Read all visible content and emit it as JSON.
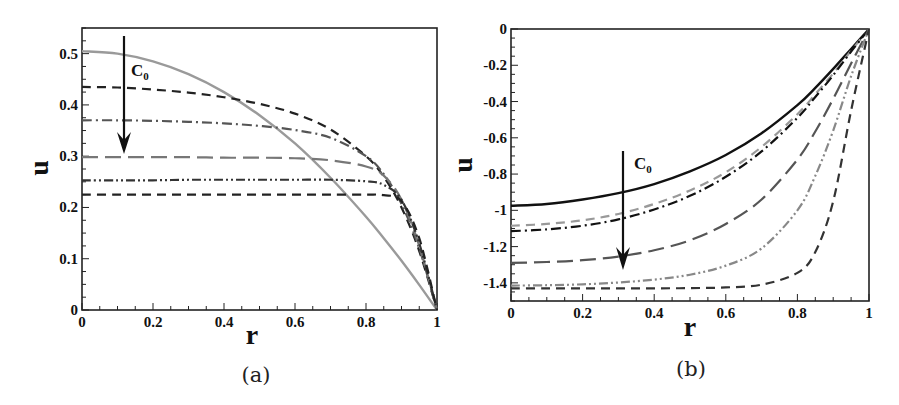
{
  "chart_data": [
    {
      "type": "line",
      "panel": "(a)",
      "xlabel": "r",
      "ylabel": "u",
      "xlim": [
        0,
        1
      ],
      "ylim": [
        0,
        0.55
      ],
      "xticks": [
        "0",
        "0.2",
        "0.4",
        "0.6",
        "0.8",
        "1"
      ],
      "yticks": [
        "0",
        "0.1",
        "0.2",
        "0.3",
        "0.4",
        "0.5"
      ],
      "grid": false,
      "annotation": {
        "text": "C",
        "subscript": "0",
        "arrow": "down",
        "meaning": "curves ordered with increasing C0"
      },
      "x": [
        0,
        0.1,
        0.2,
        0.3,
        0.4,
        0.5,
        0.6,
        0.7,
        0.8,
        0.85,
        0.9,
        0.95,
        1.0
      ],
      "series": [
        {
          "name": "curve-1",
          "style": "solid",
          "color": "#9a9a9a",
          "values": [
            0.505,
            0.5,
            0.485,
            0.46,
            0.425,
            0.38,
            0.325,
            0.258,
            0.182,
            0.14,
            0.096,
            0.049,
            0.0
          ]
        },
        {
          "name": "curve-2",
          "style": "dashed",
          "color": "#222222",
          "values": [
            0.435,
            0.434,
            0.43,
            0.424,
            0.415,
            0.402,
            0.383,
            0.352,
            0.3,
            0.26,
            0.2,
            0.115,
            0.0
          ]
        },
        {
          "name": "curve-3",
          "style": "dash-dot",
          "color": "#555555",
          "values": [
            0.37,
            0.37,
            0.369,
            0.367,
            0.364,
            0.359,
            0.351,
            0.336,
            0.3,
            0.265,
            0.207,
            0.12,
            0.0
          ]
        },
        {
          "name": "curve-4",
          "style": "long-dash",
          "color": "#777777",
          "values": [
            0.298,
            0.298,
            0.298,
            0.298,
            0.297,
            0.297,
            0.296,
            0.292,
            0.28,
            0.262,
            0.215,
            0.125,
            0.0
          ]
        },
        {
          "name": "curve-5",
          "style": "dash-dot-dot",
          "color": "#333333",
          "values": [
            0.253,
            0.253,
            0.253,
            0.254,
            0.254,
            0.254,
            0.254,
            0.254,
            0.251,
            0.244,
            0.215,
            0.13,
            0.0
          ]
        },
        {
          "name": "curve-6",
          "style": "dashed",
          "color": "#222222",
          "values": [
            0.225,
            0.225,
            0.225,
            0.225,
            0.225,
            0.225,
            0.225,
            0.225,
            0.225,
            0.224,
            0.212,
            0.14,
            0.0
          ]
        }
      ]
    },
    {
      "type": "line",
      "panel": "(b)",
      "xlabel": "r",
      "ylabel": "u",
      "xlim": [
        0,
        1
      ],
      "ylim": [
        -1.5,
        0
      ],
      "xticks": [
        "0",
        "0.2",
        "0.4",
        "0.6",
        "0.8",
        "1"
      ],
      "yticks": [
        "0",
        "-0.2",
        "-0.4",
        "-0.6",
        "-0.8",
        "-1",
        "-1.2",
        "-1.4"
      ],
      "grid": false,
      "annotation": {
        "text": "C",
        "subscript": "0",
        "arrow": "down",
        "meaning": "curves ordered with increasing C0"
      },
      "x": [
        0,
        0.1,
        0.2,
        0.3,
        0.4,
        0.5,
        0.6,
        0.7,
        0.8,
        0.85,
        0.9,
        0.95,
        1.0
      ],
      "series": [
        {
          "name": "curve-1",
          "style": "solid",
          "color": "#111111",
          "values": [
            -0.975,
            -0.965,
            -0.94,
            -0.905,
            -0.855,
            -0.785,
            -0.695,
            -0.575,
            -0.42,
            -0.325,
            -0.22,
            -0.11,
            0.0
          ]
        },
        {
          "name": "curve-2",
          "style": "dashed",
          "color": "#999999",
          "values": [
            -1.085,
            -1.075,
            -1.055,
            -1.02,
            -0.965,
            -0.89,
            -0.79,
            -0.65,
            -0.47,
            -0.36,
            -0.245,
            -0.12,
            0.0
          ]
        },
        {
          "name": "curve-3",
          "style": "dash-dot",
          "color": "#111111",
          "values": [
            -1.115,
            -1.105,
            -1.085,
            -1.05,
            -0.995,
            -0.92,
            -0.815,
            -0.675,
            -0.49,
            -0.375,
            -0.255,
            -0.125,
            0.0
          ]
        },
        {
          "name": "curve-4",
          "style": "long-dash",
          "color": "#555555",
          "values": [
            -1.29,
            -1.285,
            -1.275,
            -1.255,
            -1.22,
            -1.165,
            -1.075,
            -0.94,
            -0.72,
            -0.565,
            -0.385,
            -0.19,
            0.0
          ]
        },
        {
          "name": "curve-5",
          "style": "dash-dot-dot",
          "color": "#888888",
          "values": [
            -1.415,
            -1.413,
            -1.408,
            -1.398,
            -1.382,
            -1.355,
            -1.305,
            -1.21,
            -1.0,
            -0.81,
            -0.56,
            -0.26,
            0.0
          ]
        },
        {
          "name": "curve-6",
          "style": "dashed",
          "color": "#333333",
          "values": [
            -1.43,
            -1.43,
            -1.43,
            -1.43,
            -1.43,
            -1.429,
            -1.425,
            -1.41,
            -1.345,
            -1.23,
            -0.95,
            -0.45,
            0.0
          ]
        }
      ]
    }
  ],
  "panels": [
    {
      "id": "a",
      "caption": "(a)",
      "xlabel": "r",
      "ylabel": "u",
      "annotation_main": "C",
      "annotation_sub": "0"
    },
    {
      "id": "b",
      "caption": "(b)",
      "xlabel": "r",
      "ylabel": "u",
      "annotation_main": "C",
      "annotation_sub": "0"
    }
  ]
}
